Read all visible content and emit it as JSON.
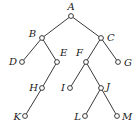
{
  "diagram": {
    "type": "binary-tree",
    "nodes": [
      {
        "id": "A",
        "label": "A"
      },
      {
        "id": "B",
        "label": "B"
      },
      {
        "id": "C",
        "label": "C"
      },
      {
        "id": "D",
        "label": "D"
      },
      {
        "id": "E",
        "label": "E"
      },
      {
        "id": "F",
        "label": "F"
      },
      {
        "id": "G",
        "label": "G"
      },
      {
        "id": "H",
        "label": "H"
      },
      {
        "id": "I",
        "label": "I"
      },
      {
        "id": "J",
        "label": "J"
      },
      {
        "id": "K",
        "label": "K"
      },
      {
        "id": "L",
        "label": "L"
      },
      {
        "id": "M",
        "label": "M"
      }
    ],
    "edges": [
      [
        "A",
        "B"
      ],
      [
        "A",
        "C"
      ],
      [
        "B",
        "D"
      ],
      [
        "B",
        "E"
      ],
      [
        "C",
        "F"
      ],
      [
        "C",
        "G"
      ],
      [
        "E",
        "H"
      ],
      [
        "H",
        "K"
      ],
      [
        "F",
        "I"
      ],
      [
        "F",
        "J"
      ],
      [
        "J",
        "L"
      ],
      [
        "J",
        "M"
      ]
    ]
  }
}
